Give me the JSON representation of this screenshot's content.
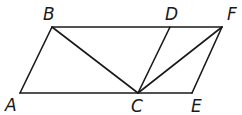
{
  "diagram": {
    "type": "geometry",
    "points": {
      "A": {
        "label": "A",
        "x": 20,
        "y": 93
      },
      "B": {
        "label": "B",
        "x": 52,
        "y": 27
      },
      "C": {
        "label": "C",
        "x": 138,
        "y": 93
      },
      "D": {
        "label": "D",
        "x": 170,
        "y": 27
      },
      "E": {
        "label": "E",
        "x": 192,
        "y": 93
      },
      "F": {
        "label": "F",
        "x": 222,
        "y": 27
      }
    },
    "segments": [
      [
        "A",
        "B"
      ],
      [
        "B",
        "F"
      ],
      [
        "A",
        "E"
      ],
      [
        "E",
        "F"
      ],
      [
        "B",
        "C"
      ],
      [
        "C",
        "D"
      ],
      [
        "C",
        "F"
      ]
    ],
    "labels": {
      "A": "A",
      "B": "B",
      "C": "C",
      "D": "D",
      "E": "E",
      "F": "F"
    },
    "colors": {
      "line": "#1a1a1a",
      "background": "#ffffff"
    }
  }
}
